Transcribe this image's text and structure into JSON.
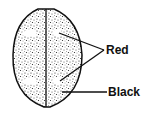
{
  "diagram": {
    "labels": [
      {
        "text": "Red",
        "points_to": "light spots"
      },
      {
        "text": "Black",
        "points_to": "stippled body"
      }
    ],
    "colors": {
      "ink": "#111111",
      "background": "#ffffff",
      "spot": "#ffffff"
    }
  }
}
